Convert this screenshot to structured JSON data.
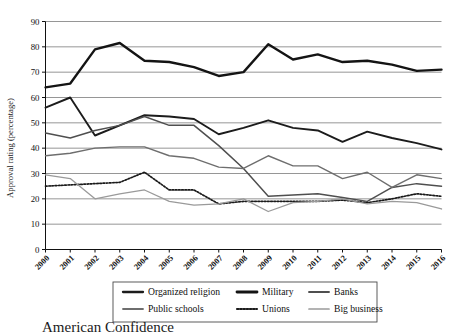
{
  "chart_data": {
    "type": "line",
    "title": "",
    "xlabel": "",
    "ylabel": "Approval rating (percentage)",
    "ylim": [
      0,
      90
    ],
    "ytick_step": 10,
    "grid": true,
    "legend_position": "below-axis",
    "x": [
      2000,
      2001,
      2002,
      2003,
      2004,
      2005,
      2006,
      2007,
      2008,
      2009,
      2010,
      2011,
      2012,
      2013,
      2014,
      2015,
      2016
    ],
    "categories": [
      "2000",
      "2001",
      "2002",
      "2003",
      "2004",
      "2005",
      "2006",
      "2007",
      "2008",
      "2009",
      "2010",
      "2011",
      "2012",
      "2013",
      "2014",
      "2015",
      "2016"
    ],
    "yticks": [
      "0",
      "10",
      "20",
      "30",
      "40",
      "50",
      "60",
      "70",
      "80",
      "90"
    ],
    "series": [
      {
        "name": "Organized religion",
        "color": "#1c1c1c",
        "width": 1.9,
        "dash": "none",
        "values": [
          56,
          60,
          45,
          49,
          53,
          52.5,
          51.5,
          45.5,
          48,
          51,
          48,
          47,
          42.5,
          46.5,
          44,
          42,
          39.5
        ]
      },
      {
        "name": "Military",
        "color": "#141414",
        "width": 2.4,
        "dash": "none",
        "values": [
          64,
          65.5,
          79,
          81.5,
          74.5,
          74,
          72,
          68.5,
          70,
          81,
          75,
          77,
          74,
          74.5,
          73,
          70.5,
          71
        ]
      },
      {
        "name": "Banks",
        "color": "#4f4f4f",
        "width": 1.5,
        "dash": "none",
        "values": [
          46,
          44,
          47,
          49,
          52.5,
          49,
          49,
          41,
          32,
          21,
          21.5,
          22,
          20.5,
          19,
          24.5,
          26,
          25
        ]
      },
      {
        "name": "Public schools",
        "color": "#6e6e6e",
        "width": 1.4,
        "dash": "none",
        "values": [
          37,
          38,
          40,
          40.5,
          40.5,
          37,
          36,
          32.5,
          32,
          37,
          33,
          33,
          28,
          30.5,
          24.5,
          29.5,
          28
        ]
      },
      {
        "name": "Unions",
        "color": "#1a1a1a",
        "width": 1.7,
        "dash": "1.6,1.6",
        "values": [
          25,
          25.5,
          26,
          26.5,
          30.5,
          23.5,
          23.5,
          18,
          19,
          19,
          19,
          19,
          19.5,
          18.5,
          20,
          22,
          21
        ]
      },
      {
        "name": "Big business",
        "color": "#9a9a9a",
        "width": 1.3,
        "dash": "none",
        "values": [
          29.5,
          28,
          20,
          22,
          23.5,
          19,
          17.5,
          18,
          20,
          15,
          18.5,
          19,
          20,
          18,
          19,
          18.5,
          16
        ]
      }
    ]
  },
  "legend": {
    "entries": [
      {
        "label": "Organized religion"
      },
      {
        "label": "Military"
      },
      {
        "label": "Banks"
      },
      {
        "label": "Public schools"
      },
      {
        "label": "Unions"
      },
      {
        "label": "Big business"
      }
    ]
  },
  "caption": {
    "text": "American Confidence"
  }
}
